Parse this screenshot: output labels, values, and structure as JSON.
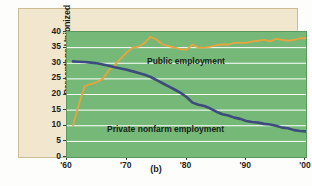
{
  "caption": "(b)",
  "chart_data": {
    "type": "line",
    "title": "",
    "xlabel": "",
    "ylabel": "Percentage Unionized",
    "xlim": [
      1960,
      2000
    ],
    "ylim": [
      0,
      40
    ],
    "grid": true,
    "gridline_values": [
      5,
      10,
      15,
      20,
      25,
      30,
      35
    ],
    "legend_position": "inline-annotations",
    "ytick_labels": [
      "0",
      "5",
      "10",
      "15",
      "20",
      "25",
      "30",
      "35",
      "40"
    ],
    "ytick_values": [
      0,
      5,
      10,
      15,
      20,
      25,
      30,
      35,
      40
    ],
    "xtick_labels": [
      "'60",
      "'70",
      "'80",
      "'90",
      "'00"
    ],
    "xtick_values": [
      1960,
      1970,
      1980,
      1990,
      2000
    ],
    "colors": {
      "public": "#e8a53e",
      "private": "#3d4c7d",
      "plot_background": "#76b878",
      "panel_background": "#f1e7ce",
      "gridline": "#ffffff",
      "panel_border": "#cdbb95"
    },
    "series": [
      {
        "name": "Public employment",
        "color": "#e8a53e",
        "x": [
          1961,
          1962,
          1963,
          1964,
          1965,
          1966,
          1967,
          1968,
          1969,
          1970,
          1971,
          1972,
          1973,
          1974,
          1975,
          1976,
          1977,
          1978,
          1979,
          1980,
          1981,
          1982,
          1983,
          1984,
          1985,
          1986,
          1987,
          1988,
          1989,
          1990,
          1991,
          1992,
          1993,
          1994,
          1995,
          1996,
          1997,
          1998,
          1999,
          2000
        ],
        "values": [
          10.0,
          17.0,
          22.8,
          23.3,
          24.0,
          25.0,
          27.8,
          29.5,
          31.5,
          33.5,
          35.0,
          35.3,
          36.5,
          38.5,
          37.5,
          36.0,
          35.5,
          35.0,
          34.5,
          34.3,
          36.0,
          35.0,
          35.0,
          35.3,
          35.8,
          36.0,
          36.0,
          36.5,
          36.5,
          36.5,
          37.0,
          37.2,
          37.5,
          37.0,
          37.8,
          37.5,
          37.2,
          37.5,
          38.0,
          38.0
        ]
      },
      {
        "name": "Private nonfarm employment",
        "color": "#3d4c7d",
        "x": [
          1961,
          1962,
          1963,
          1964,
          1965,
          1966,
          1967,
          1968,
          1969,
          1970,
          1971,
          1972,
          1973,
          1974,
          1975,
          1976,
          1977,
          1978,
          1979,
          1980,
          1981,
          1982,
          1983,
          1984,
          1985,
          1986,
          1987,
          1988,
          1989,
          1990,
          1991,
          1992,
          1993,
          1994,
          1995,
          1996,
          1997,
          1998,
          1999,
          2000
        ],
        "values": [
          30.6,
          30.5,
          30.4,
          30.2,
          30.0,
          29.6,
          29.2,
          28.7,
          28.3,
          27.9,
          27.4,
          26.9,
          26.3,
          25.6,
          24.6,
          23.6,
          22.6,
          21.6,
          20.5,
          19.2,
          17.4,
          16.7,
          16.3,
          15.5,
          14.5,
          13.7,
          13.3,
          12.6,
          12.2,
          11.5,
          11.2,
          11.0,
          10.6,
          10.4,
          10.0,
          9.4,
          9.2,
          8.6,
          8.3,
          8.2
        ]
      }
    ],
    "annotations": [
      {
        "text": "Public employment",
        "x": 1979,
        "y": 30
      },
      {
        "text": "Private nonfarm employment",
        "x": 1973,
        "y": 12
      }
    ]
  }
}
